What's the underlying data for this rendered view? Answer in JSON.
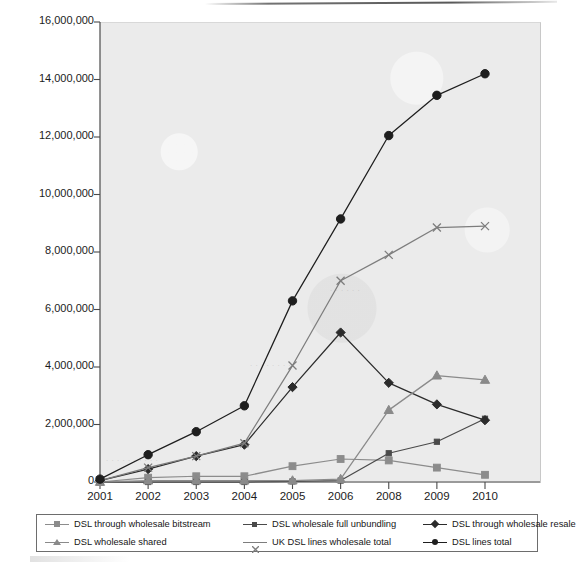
{
  "chart_data": {
    "type": "line",
    "title": "",
    "subtitle": "",
    "xlabel": "",
    "ylabel": "",
    "categories": [
      "2001",
      "2002",
      "2003",
      "2004",
      "2005",
      "2006",
      "2008",
      "2009",
      "2010"
    ],
    "ylim": [
      0,
      16000000
    ],
    "ytick_step": 2000000,
    "ytick_labels": [
      "0",
      "2,000,000",
      "4,000,000",
      "6,000,000",
      "8,000,000",
      "10,000,000",
      "12,000,000",
      "14,000,000",
      "16,000,000"
    ],
    "grid": false,
    "legend_position": "bottom",
    "plot_background": "#ebebeb",
    "series": [
      {
        "name": "DSL through wholesale bitstream",
        "marker": "square",
        "color": "#8c8c8c",
        "values": [
          0,
          150000,
          200000,
          200000,
          550000,
          800000,
          750000,
          500000,
          250000
        ]
      },
      {
        "name": "DSL wholesale full unbundling",
        "marker": "small-square",
        "color": "#4a4a4a",
        "values": [
          0,
          0,
          0,
          0,
          20000,
          50000,
          1000000,
          1400000,
          2200000
        ]
      },
      {
        "name": "DSL through wholesale resale",
        "marker": "diamond",
        "color": "#2b2b2b",
        "values": [
          50000,
          450000,
          900000,
          1300000,
          3300000,
          5200000,
          3450000,
          2700000,
          2150000
        ]
      },
      {
        "name": "DSL wholesale shared",
        "marker": "triangle",
        "color": "#8a8a8a",
        "values": [
          0,
          50000,
          50000,
          50000,
          50000,
          100000,
          2500000,
          3700000,
          3550000
        ]
      },
      {
        "name": "UK DSL lines wholesale total",
        "marker": "cross",
        "color": "#7d7d7d",
        "values": [
          50000,
          500000,
          900000,
          1350000,
          4050000,
          7000000,
          7900000,
          8850000,
          8900000
        ]
      },
      {
        "name": "DSL lines total",
        "marker": "circle",
        "color": "#1e1e1e",
        "values": [
          100000,
          950000,
          1750000,
          2650000,
          6300000,
          9150000,
          12050000,
          13450000,
          14200000
        ]
      }
    ]
  },
  "legend": {
    "items": [
      {
        "label": "DSL through wholesale bitstream",
        "marker": "square",
        "color": "#8c8c8c"
      },
      {
        "label": "DSL wholesale shared",
        "marker": "triangle",
        "color": "#8a8a8a"
      },
      {
        "label": "DSL wholesale full unbundling",
        "marker": "small-square",
        "color": "#4a4a4a"
      },
      {
        "label": "UK DSL lines wholesale total",
        "marker": "cross",
        "color": "#7d7d7d"
      },
      {
        "label": "DSL through wholesale resale",
        "marker": "diamond",
        "color": "#2b2b2b"
      },
      {
        "label": "DSL lines total",
        "marker": "circle",
        "color": "#1e1e1e"
      }
    ]
  },
  "artifacts": {
    "ghost_text": [
      "D S L",
      "tot al",
      "wholes ale",
      "lin es"
    ]
  }
}
